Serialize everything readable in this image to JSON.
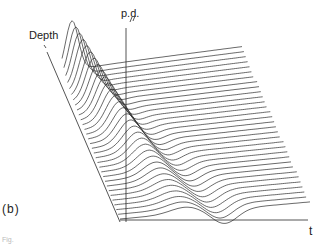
{
  "figure": {
    "panel_label": "(b)",
    "caption_fragment": "Fig.",
    "axes": {
      "depth_label": "Depth",
      "pd_label": "p.d.",
      "time_label": "t"
    },
    "colors": {
      "background": "#ffffff",
      "line": "#2a2a2a"
    },
    "geometry": {
      "depth_axis": {
        "x1": 47,
        "y1": 52,
        "x2": 120,
        "y2": 222
      },
      "pd_axis": {
        "x1": 126,
        "y1": 28,
        "x2": 126,
        "y2": 222
      },
      "t_axis": {
        "x1": 120,
        "y1": 220,
        "x2": 308,
        "y2": 220
      },
      "trace_count": 32,
      "trace_length": 190
    }
  }
}
